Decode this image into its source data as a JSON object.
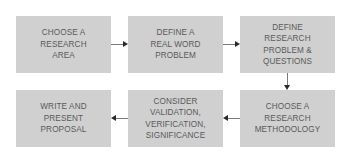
{
  "diagram": {
    "type": "flowchart",
    "colors": {
      "box_fill": "#d0d0d0",
      "text": "#5a5a5a",
      "arrow": "#2a2a2a"
    },
    "steps": [
      {
        "id": 1,
        "label": "CHOOSE A\nRESEARCH\nAREA"
      },
      {
        "id": 2,
        "label": "DEFINE A\nREAL WORD\nPROBLEM"
      },
      {
        "id": 3,
        "label": "DEFINE\nRESEARCH\nPROBLEM &\nQUESTIONS"
      },
      {
        "id": 4,
        "label": "CHOOSE A\nRESEARCH\nMETHODOLOGY"
      },
      {
        "id": 5,
        "label": "CONSIDER\nVALIDATION,\nVERIFICATION,\nSIGNIFICANCE"
      },
      {
        "id": 6,
        "label": "WRITE AND\nPRESENT\nPROPOSAL"
      }
    ],
    "edges": [
      {
        "from": 1,
        "to": 2,
        "direction": "right"
      },
      {
        "from": 2,
        "to": 3,
        "direction": "right"
      },
      {
        "from": 3,
        "to": 4,
        "direction": "down"
      },
      {
        "from": 4,
        "to": 5,
        "direction": "left"
      },
      {
        "from": 5,
        "to": 6,
        "direction": "left"
      }
    ]
  }
}
